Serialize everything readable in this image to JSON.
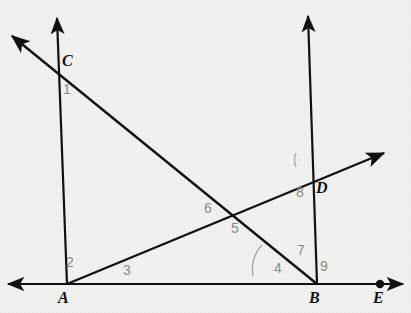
{
  "figure": {
    "background_color": "#f1f1ef",
    "stroke_color": "#111111",
    "label_color": "#111111",
    "angle_label_color": "#8a8a88",
    "arc_color": "#a9a9a6"
  },
  "points": [
    {
      "name": "A",
      "label": "A",
      "x": 67,
      "y": 284,
      "label_x": 58,
      "label_y": 290,
      "dot": false
    },
    {
      "name": "B",
      "label": "B",
      "x": 317,
      "y": 284,
      "label_x": 309,
      "label_y": 290,
      "dot": false
    },
    {
      "name": "C",
      "label": "C",
      "x": 57,
      "y": 65,
      "label_x": 62,
      "label_y": 53,
      "dot": false
    },
    {
      "name": "D",
      "label": "D",
      "x": 308,
      "y": 178,
      "label_x": 316,
      "label_y": 180,
      "dot": false
    },
    {
      "name": "E",
      "label": "E",
      "x": 380,
      "y": 284,
      "label_x": 373,
      "label_y": 290,
      "dot": true
    }
  ],
  "lines": [
    {
      "name": "horizontal-base-line",
      "x1": 8,
      "y1": 284,
      "x2": 403,
      "y2": 284,
      "arrow_start": true,
      "arrow_end": true
    },
    {
      "name": "vertical-ray-at-A",
      "x1": 67,
      "y1": 284,
      "x2": 57,
      "y2": 16,
      "arrow_start": false,
      "arrow_end": true
    },
    {
      "name": "vertical-ray-at-B",
      "x1": 317,
      "y1": 284,
      "x2": 308,
      "y2": 14,
      "arrow_start": false,
      "arrow_end": true
    },
    {
      "name": "descending-transversal-through-C-and-B",
      "x1": 10,
      "y1": 34,
      "x2": 317,
      "y2": 284,
      "arrow_start": true,
      "arrow_end": false
    },
    {
      "name": "ascending-ray-from-A-through-D",
      "x1": 67,
      "y1": 284,
      "x2": 386,
      "y2": 152,
      "arrow_start": false,
      "arrow_end": true
    }
  ],
  "intersections": [
    {
      "name": "crossing-of-transversals",
      "x": 236,
      "y": 216
    }
  ],
  "angle_labels": [
    {
      "id": "1",
      "text": "1",
      "x": 63,
      "y": 82,
      "at": "C"
    },
    {
      "id": "2",
      "text": "2",
      "x": 66,
      "y": 255,
      "at": "A"
    },
    {
      "id": "3",
      "text": "3",
      "x": 123,
      "y": 263,
      "at": "A"
    },
    {
      "id": "4",
      "text": "4",
      "x": 274,
      "y": 261,
      "at": "B"
    },
    {
      "id": "5",
      "text": "5",
      "x": 231,
      "y": 221,
      "at": "crossing"
    },
    {
      "id": "6",
      "text": "6",
      "x": 204,
      "y": 201,
      "at": "crossing"
    },
    {
      "id": "7",
      "text": "7",
      "x": 297,
      "y": 243,
      "at": "B"
    },
    {
      "id": "8",
      "text": "8",
      "x": 296,
      "y": 185,
      "at": "D"
    },
    {
      "id": "9",
      "text": "9",
      "x": 320,
      "y": 259,
      "at": "B"
    }
  ],
  "angle_arcs": [
    {
      "name": "arc-at-B-angle-4",
      "path": "M 262,245 Q 250,258 253,276"
    },
    {
      "name": "arc-at-D-angle-upper-left",
      "path": "M 296,153 Q 293,160 296,167"
    }
  ]
}
